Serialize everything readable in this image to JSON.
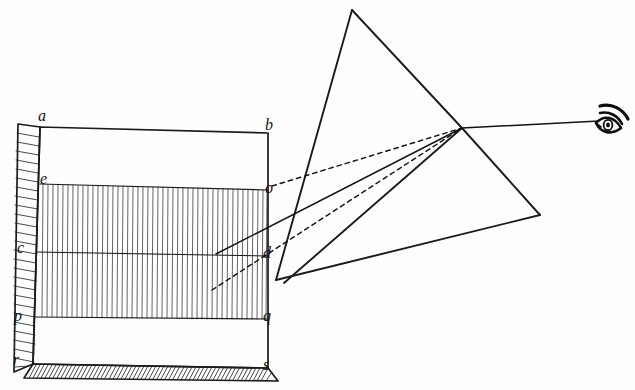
{
  "figure": {
    "background_color": "#fefefe",
    "ink_color": "#1b1b1b",
    "width": 635,
    "height": 390
  },
  "labels": [
    {
      "id": "a",
      "text": "a",
      "x": 38,
      "y": 108,
      "corner": "top-left-front"
    },
    {
      "id": "b",
      "text": "b",
      "x": 265,
      "y": 117,
      "corner": "top-right-front"
    },
    {
      "id": "e",
      "text": "e",
      "x": 40,
      "y": 171,
      "corner": "upper-band-left"
    },
    {
      "id": "o",
      "text": "o",
      "x": 265,
      "y": 180,
      "corner": "upper-band-right"
    },
    {
      "id": "c",
      "text": "c",
      "x": 17,
      "y": 240,
      "corner": "mid-line-left"
    },
    {
      "id": "d",
      "text": "d",
      "x": 263,
      "y": 245,
      "corner": "mid-line-right"
    },
    {
      "id": "p",
      "text": "p",
      "x": 14,
      "y": 308,
      "corner": "lower-band-left"
    },
    {
      "id": "q",
      "text": "q",
      "x": 263,
      "y": 308,
      "corner": "lower-band-right"
    },
    {
      "id": "r",
      "text": "r",
      "x": 13,
      "y": 352,
      "corner": "bottom-left-front"
    },
    {
      "id": "s",
      "text": "s",
      "x": 263,
      "y": 357,
      "corner": "bottom-right-front"
    }
  ],
  "screen": {
    "name": "labelled card / screen",
    "front_face": {
      "a": [
        40,
        127
      ],
      "b": [
        268,
        133
      ],
      "s": [
        268,
        368
      ],
      "r": [
        33,
        364
      ]
    },
    "left_side_face": {
      "top_back": [
        18,
        124
      ],
      "top_front": [
        40,
        127
      ],
      "bottom_front": [
        33,
        364
      ],
      "bottom_back": [
        14,
        372
      ]
    },
    "bottom_face": {
      "front_left": [
        33,
        364
      ],
      "front_right": [
        268,
        368
      ],
      "back_right": [
        278,
        381
      ],
      "back_left": [
        24,
        378
      ]
    },
    "bands": {
      "eo_line_y_left": 184,
      "eo_line_y_right": 190,
      "cd_line_y_left": 252,
      "cd_line_y_right": 256,
      "pq_line_y_left": 317,
      "pq_line_y_right": 319
    },
    "hatched_band": {
      "description": "dense vertical ruling between line e-o and line p-q",
      "stroke_count": 46,
      "orientation": "vertical"
    },
    "side_hatch": {
      "description": "diagonal hatching on left side face",
      "stroke_count": 26,
      "orientation": "diagonal"
    },
    "base_hatch": {
      "description": "diagonal hatching on bottom face strip",
      "stroke_count": 58,
      "orientation": "diagonal"
    }
  },
  "prism": {
    "name": "triangular glass prism",
    "apex": [
      352,
      10
    ],
    "front_bottom_left": [
      276,
      280
    ],
    "front_bottom_right": [
      540,
      215
    ],
    "back_top": [
      352,
      10
    ],
    "near_face_bottom": [
      276,
      280
    ],
    "far_face_bottom": [
      540,
      215
    ],
    "mid_edge_top": [
      462,
      128
    ],
    "mid_edge_bottom": [
      284,
      283
    ]
  },
  "rays": [
    {
      "id": "ray-solid-o",
      "style": "solid",
      "from": [
        216,
        254
      ],
      "to": [
        462,
        128
      ],
      "description": "principal refracted ray from point on screen to eye"
    },
    {
      "id": "ray-dotted-upper",
      "style": "dotted",
      "from": [
        272,
        186
      ],
      "to": [
        462,
        128
      ],
      "description": "upper dotted construction ray from o"
    },
    {
      "id": "ray-dotted-lower",
      "style": "dotted",
      "from": [
        212,
        290
      ],
      "to": [
        462,
        128
      ],
      "description": "lower dotted construction ray"
    },
    {
      "id": "ray-to-eye",
      "style": "solid",
      "from": [
        462,
        128
      ],
      "to": [
        600,
        121
      ],
      "description": "emergent ray travelling to the observer's eye"
    }
  ],
  "eye": {
    "name": "observer eye symbol",
    "center": [
      605,
      122
    ],
    "description": "stylised human eye with brow arcs viewing the prism"
  }
}
